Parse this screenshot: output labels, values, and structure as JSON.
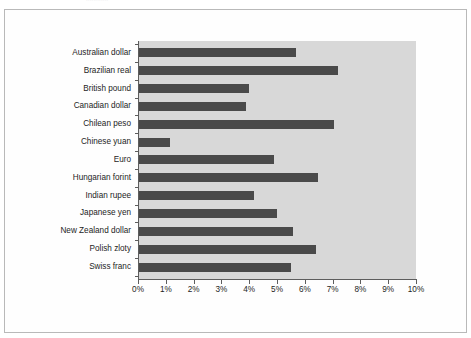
{
  "figure": {
    "top_clipped_text": "............",
    "frame_color": "#b9b9b9",
    "plot_background": "#d8d8d8",
    "bar_color": "#4a4a4a",
    "axis_color": "#5d5d5d",
    "text_color": "#1d1d1d"
  },
  "chart_data": {
    "type": "bar",
    "orientation": "horizontal",
    "title": "",
    "subtitle": "",
    "xlabel": "",
    "ylabel": "",
    "xlim": [
      0,
      10
    ],
    "ylim": null,
    "grid": false,
    "legend": null,
    "legend_position": "none",
    "categories": [
      "Australian dollar",
      "Brazilian real",
      "British pound",
      "Canadian dollar",
      "Chilean peso",
      "Chinese yuan",
      "Euro",
      "Hungarian forint",
      "Indian rupee",
      "Japanese yen",
      "New Zealand dollar",
      "Polish zloty",
      "Swiss franc"
    ],
    "values": [
      5.65,
      7.15,
      3.95,
      3.85,
      7.0,
      1.1,
      4.85,
      6.45,
      4.15,
      4.95,
      5.55,
      6.35,
      5.45
    ],
    "value_unit": "%",
    "xticks": [
      0,
      1,
      2,
      3,
      4,
      5,
      6,
      7,
      8,
      9,
      10
    ],
    "xtick_labels": [
      "0%",
      "1%",
      "2%",
      "3%",
      "4%",
      "5%",
      "6%",
      "7%",
      "8%",
      "9%",
      "10%"
    ]
  }
}
